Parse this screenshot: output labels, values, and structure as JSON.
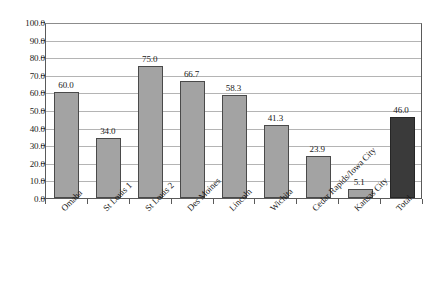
{
  "chart_data": {
    "type": "bar",
    "title": "",
    "subtitle": "",
    "xlabel": "",
    "ylabel": "",
    "categories": [
      "Omaha",
      "St Louis 1",
      "St Louis 2",
      "Des Moines",
      "Lincoln",
      "Wichita",
      "Cedar Rapids/Iowa City",
      "Kansas City",
      "Total"
    ],
    "values": [
      60.0,
      34.0,
      75.0,
      66.7,
      58.3,
      41.3,
      23.9,
      5.1,
      46.0
    ],
    "value_labels": [
      "60.0",
      "34.0",
      "75.0",
      "66.7",
      "58.3",
      "41.3",
      "23.9",
      "5.1",
      "46.0"
    ],
    "ylim": [
      0,
      100
    ],
    "ytick_step": 10,
    "ytick_labels": [
      "0.0",
      "10.0",
      "20.0",
      "30.0",
      "40.0",
      "50.0",
      "60.0",
      "70.0",
      "80.0",
      "90.0",
      "100.0"
    ],
    "ytick_values": [
      0,
      10,
      20,
      30,
      40,
      50,
      60,
      70,
      80,
      90,
      100
    ],
    "grid": true,
    "grid_axis": "y",
    "legend": false,
    "legend_position": "none",
    "bar_color": "#a3a3a3",
    "bar_border_color": "#4a4a4a",
    "highlight_index": 8,
    "highlight_color": "#3a3a3a",
    "gridline_color": "#b4b4b4",
    "axis_color": "#5a5a5a",
    "text_color": "#1a1a1a",
    "background_color": "#ffffff",
    "xlabel_rotation": -45
  }
}
